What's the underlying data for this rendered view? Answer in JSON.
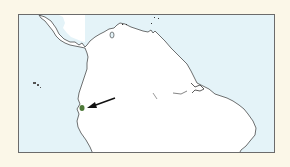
{
  "map": {
    "region": "Northern South America",
    "colors": {
      "page_background": "#fbf7e8",
      "sea": "#e4f3f8",
      "land": "#ffffff",
      "coastline": "#333333",
      "frame": "#6b6b6b",
      "highlight_area": "#4f7a3a",
      "arrow": "#111111"
    },
    "highlight": {
      "label": "distribution-area",
      "cx": 81,
      "cy": 107
    },
    "arrow": {
      "from": [
        114,
        97
      ],
      "to": [
        88,
        106
      ]
    }
  }
}
